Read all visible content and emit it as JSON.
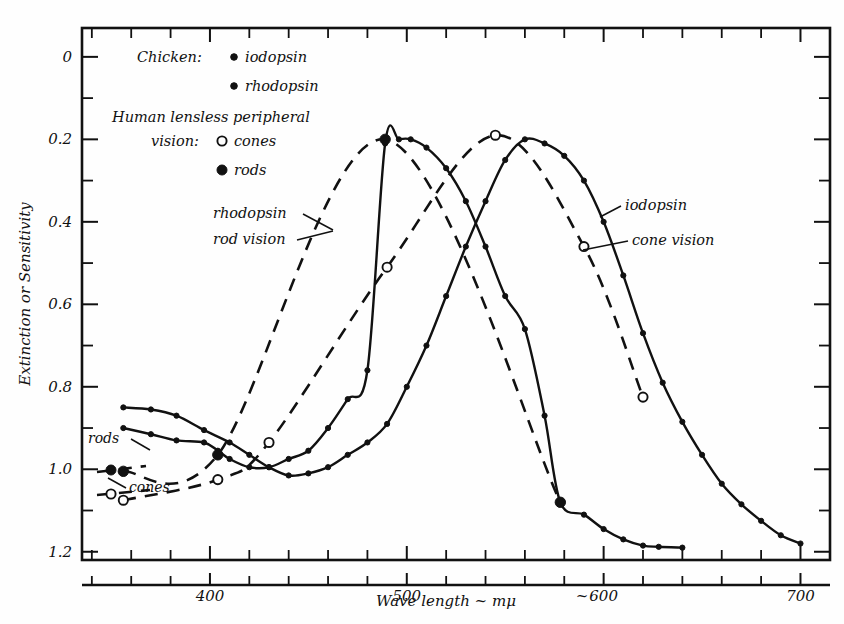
{
  "figure": {
    "background": "#fefefe",
    "ink": "#111111"
  },
  "chart_data": {
    "type": "line",
    "title": "",
    "xlabel": "Wave length ~ mμ",
    "ylabel": "Extinction or Sensitivity",
    "xlim": [
      335,
      715
    ],
    "ylim": [
      -0.02,
      1.27
    ],
    "grid": false,
    "legend_position": "upper-left inside plot",
    "x_ticks_major": [
      400,
      500,
      600,
      700
    ],
    "x_tick_labels": [
      "400",
      "500",
      "600",
      "700"
    ],
    "x_tick_minor_step": 20,
    "y_ticks_major": [
      0,
      0.2,
      0.4,
      0.6,
      0.8,
      1.0,
      1.2
    ],
    "y_tick_labels": [
      "0",
      "0.2",
      "0.4",
      "0.6",
      "0.8",
      "1.0",
      "1.2"
    ],
    "y_tick_minor_step": 0.1,
    "series": [
      {
        "name": "rhodopsin (chicken)",
        "style": "solid",
        "marker": "small-filled-dot",
        "x": [
          356,
          370,
          383,
          397,
          404,
          410,
          420,
          430,
          440,
          450,
          460,
          470,
          480,
          489,
          496,
          502,
          510,
          520,
          530,
          540,
          550,
          560,
          570,
          578,
          590,
          600,
          610,
          620,
          628,
          640
        ],
        "y": [
          0.3,
          0.285,
          0.27,
          0.265,
          0.245,
          0.225,
          0.205,
          0.205,
          0.225,
          0.245,
          0.3,
          0.37,
          0.44,
          0.99,
          1.0,
          1.0,
          0.98,
          0.93,
          0.85,
          0.74,
          0.62,
          0.54,
          0.33,
          0.12,
          0.09,
          0.055,
          0.03,
          0.015,
          0.012,
          0.01
        ]
      },
      {
        "name": "rod vision (human lensless peripheral)",
        "style": "dashed",
        "marker": "large-filled-dot",
        "x": [
          356,
          404,
          489,
          578
        ],
        "y": [
          0.195,
          0.235,
          1.0,
          0.12
        ]
      },
      {
        "name": "iodopsin (chicken)",
        "style": "solid",
        "marker": "small-filled-dot",
        "x": [
          356,
          370,
          383,
          397,
          410,
          420,
          430,
          440,
          450,
          460,
          470,
          480,
          490,
          500,
          510,
          520,
          530,
          540,
          550,
          560,
          570,
          580,
          590,
          600,
          610,
          620,
          630,
          640,
          650,
          660,
          670,
          680,
          690,
          700
        ],
        "y": [
          0.35,
          0.345,
          0.33,
          0.295,
          0.265,
          0.235,
          0.205,
          0.185,
          0.19,
          0.205,
          0.235,
          0.265,
          0.31,
          0.4,
          0.5,
          0.62,
          0.74,
          0.85,
          0.95,
          1.0,
          0.99,
          0.96,
          0.9,
          0.8,
          0.67,
          0.53,
          0.41,
          0.315,
          0.235,
          0.165,
          0.115,
          0.075,
          0.04,
          0.02
        ]
      },
      {
        "name": "cone vision (human lensless peripheral)",
        "style": "dashed",
        "marker": "large-open-circle",
        "x": [
          356,
          404,
          430,
          490,
          545,
          590,
          620
        ],
        "y": [
          0.125,
          0.175,
          0.265,
          0.69,
          1.01,
          0.74,
          0.375
        ]
      }
    ],
    "annotations": [
      {
        "id": "rhodopsin-rod-vision",
        "lines": [
          "rhodopsin",
          "rod vision"
        ],
        "x": 0.43,
        "y": 0.79
      },
      {
        "id": "iodopsin-cone-vision",
        "lines": [
          "iodopsin",
          "cone vision"
        ],
        "x": 0.6,
        "y": 0.78
      },
      {
        "id": "rods-marker-label",
        "lines": [
          "rods"
        ],
        "x": 0.365,
        "y": 0.215
      },
      {
        "id": "cones-marker-label",
        "lines": [
          "cones"
        ],
        "x": 0.385,
        "y": 0.135
      }
    ]
  },
  "legend": {
    "row1_prefix": "Chicken:",
    "row1_marker": "small-filled-dot",
    "row1_label": "iodopsin",
    "row2_marker": "small-filled-dot",
    "row2_label": "rhodopsin",
    "row3_line1": "Human lensless peripheral",
    "row3_line2_prefix": "vision:",
    "row3_marker": "large-open-circle",
    "row3_label": "cones",
    "row4_marker": "large-filled-dot",
    "row4_label": "rods"
  },
  "annotation_text": {
    "rhodopsin": "rhodopsin",
    "rod_vision": "rod vision",
    "iodopsin": "iodopsin",
    "cone_vision": "cone vision",
    "rods": "rods",
    "cones": "cones"
  },
  "axes": {
    "y_title": "Extinction or Sensitivity",
    "x_title": "Wave length ~ mμ",
    "y_labels": [
      "1.2",
      "1.0",
      "0.8",
      "0.6",
      "0.4",
      "0.2",
      "0"
    ],
    "x_labels": [
      "400",
      "500",
      "600",
      "700"
    ]
  }
}
